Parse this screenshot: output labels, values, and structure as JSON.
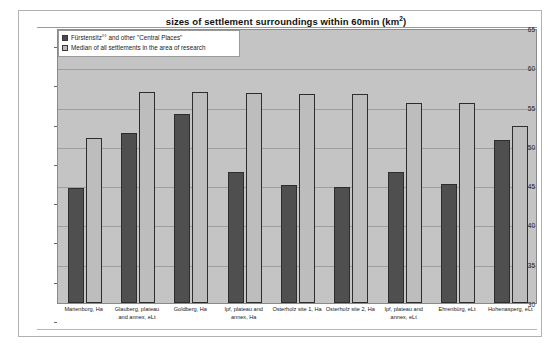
{
  "chart_data": {
    "type": "bar",
    "title": "sizes of settlement surroundings within 60min (km",
    "title_superscript": "2",
    "title_suffix": ")",
    "title_full": "sizes of settlement surroundings within 60min (km²)",
    "xlabel": "",
    "ylabel": "",
    "ylim": [
      30,
      65
    ],
    "yticks": [
      30,
      35,
      40,
      45,
      50,
      55,
      60,
      65
    ],
    "ytick_labels": [
      "30",
      "35",
      "40",
      "45",
      "50",
      "55",
      "60",
      "65"
    ],
    "grid": true,
    "legend_position": "top-left",
    "categories": [
      "Marienborg, Ha",
      "Glauberg, plateau and annex, eLt",
      "Goldberg, Ha",
      "Ipf, plateau and annex, Ha",
      "Osterholz site 1, Ha",
      "Osterholz site 2, Ha",
      "Ipf, plateau and annex, eLt",
      "Ehrenbürg, eLt",
      "Hohenasperg, eLt"
    ],
    "series": [
      {
        "name": "Fürstensitz°° and other \"Central Places\"",
        "color": "#4f4f4f",
        "values": [
          44.7,
          51.7,
          54.0,
          46.7,
          45.0,
          44.8,
          46.7,
          45.2,
          50.7
        ]
      },
      {
        "name": "Median of all settlements in the area of research",
        "color": "#bdbdbd",
        "values": [
          51.0,
          56.8,
          56.8,
          56.7,
          56.6,
          56.6,
          55.5,
          55.5,
          52.5
        ]
      }
    ],
    "plot_background": "#c4c4c4",
    "gridline_color": "#9e9e9e",
    "frame_color": "#b0b0b0"
  },
  "legend": {
    "items": [
      {
        "label": "Fürstensitz°° and other \"Central Places\"",
        "swatch": "dark"
      },
      {
        "label": "Median of all settlements in the area of research",
        "swatch": "light"
      }
    ]
  }
}
